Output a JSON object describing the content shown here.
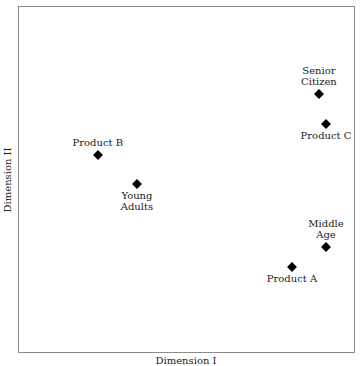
{
  "chart_data": {
    "type": "scatter",
    "title": "",
    "xlabel": "Dimension I",
    "ylabel": "Dimension II",
    "xlim": [
      0,
      100
    ],
    "ylim": [
      0,
      100
    ],
    "grid": false,
    "legend": null,
    "marker": "diamond",
    "points": [
      {
        "label": "Senior\nCitizen",
        "x": 89.3,
        "y": 74.6,
        "label_pos": "above"
      },
      {
        "label": "Product C",
        "x": 91.4,
        "y": 66.0,
        "label_pos": "below"
      },
      {
        "label": "Product B",
        "x": 23.7,
        "y": 57.1,
        "label_pos": "above"
      },
      {
        "label": "Young\nAdults",
        "x": 35.3,
        "y": 48.7,
        "label_pos": "below"
      },
      {
        "label": "Middle\nAge",
        "x": 91.4,
        "y": 30.5,
        "label_pos": "above"
      },
      {
        "label": "Product A",
        "x": 81.3,
        "y": 24.8,
        "label_pos": "below"
      }
    ]
  },
  "axes": {
    "xlabel": "Dimension I",
    "ylabel": "Dimension II"
  },
  "colors": {
    "marker": "#000000",
    "frame": "#8a8a8a",
    "text": "#222222"
  }
}
